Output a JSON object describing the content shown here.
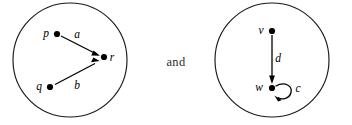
{
  "figure": {
    "width": 352,
    "height": 125,
    "background": "#ffffff",
    "ink_color": "#000000",
    "conjunction": "and"
  },
  "graphs": [
    {
      "id": "left-graph",
      "circle": {
        "cx": 70,
        "cy": 60,
        "r": 57
      },
      "nodes": [
        {
          "id": "p",
          "label": "p",
          "x": 57,
          "y": 34,
          "label_x": 46,
          "label_y": 37
        },
        {
          "id": "q",
          "label": "q",
          "x": 50,
          "y": 87,
          "label_x": 39,
          "label_y": 90
        },
        {
          "id": "r",
          "label": "r",
          "x": 104,
          "y": 57,
          "label_x": 112,
          "label_y": 61
        }
      ],
      "edges": [
        {
          "id": "a",
          "label": "a",
          "from": "p",
          "to": "r",
          "label_x": 77,
          "label_y": 38
        },
        {
          "id": "b",
          "label": "b",
          "from": "q",
          "to": "r",
          "label_x": 77,
          "label_y": 89
        }
      ]
    },
    {
      "id": "right-graph",
      "circle": {
        "cx": 272,
        "cy": 60,
        "r": 57
      },
      "nodes": [
        {
          "id": "v",
          "label": "v",
          "x": 272,
          "y": 31,
          "label_x": 261,
          "label_y": 34
        },
        {
          "id": "w",
          "label": "w",
          "x": 272,
          "y": 88,
          "label_x": 258,
          "label_y": 91
        }
      ],
      "edges": [
        {
          "id": "d",
          "label": "d",
          "from": "v",
          "to": "w",
          "label_x": 277,
          "label_y": 61
        },
        {
          "id": "c",
          "label": "c",
          "from": "w",
          "to": "w",
          "type": "self-loop",
          "label_x": 297,
          "label_y": 91
        }
      ]
    }
  ]
}
